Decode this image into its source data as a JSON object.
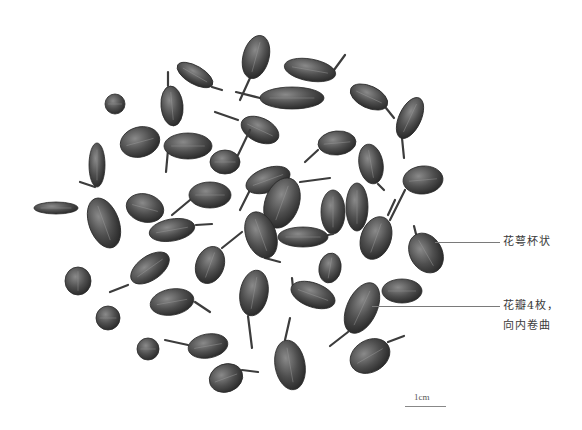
{
  "figure": {
    "background_color": "#ffffff",
    "specimen_color": "#4a4a4a"
  },
  "annotations": [
    {
      "id": "calyx",
      "text": "花萼杯状",
      "line_x1": 435,
      "line_x2": 500,
      "y": 242
    },
    {
      "id": "petals",
      "line1": "花瓣4枚，",
      "line2": "向内卷曲",
      "line_x1": 372,
      "line_x2": 500,
      "y": 306
    }
  ],
  "scale_bar": {
    "label": "1cm",
    "x1": 405,
    "x2": 446,
    "y": 406
  },
  "specimens": [
    {
      "cx": 256,
      "cy": 57,
      "rx": 13,
      "ry": 22,
      "rot": 15,
      "stem": [
        [
          250,
          78
        ],
        [
          240,
          100
        ]
      ]
    },
    {
      "cx": 310,
      "cy": 70,
      "rx": 26,
      "ry": 11,
      "rot": 10,
      "stem": [
        [
          334,
          70
        ],
        [
          345,
          55
        ]
      ]
    },
    {
      "cx": 195,
      "cy": 75,
      "rx": 20,
      "ry": 9,
      "rot": 30,
      "stem": [
        [
          212,
          87
        ],
        [
          222,
          90
        ]
      ]
    },
    {
      "cx": 115,
      "cy": 104,
      "rx": 10,
      "ry": 10,
      "rot": 0,
      "stem": null
    },
    {
      "cx": 172,
      "cy": 106,
      "rx": 11,
      "ry": 20,
      "rot": -5,
      "stem": [
        [
          168,
          86
        ],
        [
          168,
          72
        ]
      ]
    },
    {
      "cx": 292,
      "cy": 98,
      "rx": 32,
      "ry": 11,
      "rot": 0,
      "stem": [
        [
          260,
          98
        ],
        [
          236,
          92
        ]
      ]
    },
    {
      "cx": 369,
      "cy": 97,
      "rx": 20,
      "ry": 11,
      "rot": 25,
      "stem": [
        [
          386,
          108
        ],
        [
          394,
          118
        ]
      ]
    },
    {
      "cx": 410,
      "cy": 118,
      "rx": 11,
      "ry": 22,
      "rot": 25,
      "stem": [
        [
          402,
          138
        ],
        [
          404,
          158
        ]
      ]
    },
    {
      "cx": 140,
      "cy": 142,
      "rx": 20,
      "ry": 15,
      "rot": -15,
      "stem": null
    },
    {
      "cx": 188,
      "cy": 146,
      "rx": 24,
      "ry": 13,
      "rot": 0,
      "stem": [
        [
          168,
          150
        ],
        [
          166,
          172
        ]
      ]
    },
    {
      "cx": 260,
      "cy": 130,
      "rx": 20,
      "ry": 12,
      "rot": 25,
      "stem": [
        [
          238,
          120
        ],
        [
          215,
          112
        ]
      ]
    },
    {
      "cx": 225,
      "cy": 162,
      "rx": 15,
      "ry": 12,
      "rot": 0,
      "stem": [
        [
          238,
          155
        ],
        [
          250,
          130
        ]
      ]
    },
    {
      "cx": 337,
      "cy": 143,
      "rx": 19,
      "ry": 12,
      "rot": -5,
      "stem": [
        [
          318,
          150
        ],
        [
          305,
          162
        ]
      ]
    },
    {
      "cx": 371,
      "cy": 164,
      "rx": 12,
      "ry": 20,
      "rot": -10,
      "stem": [
        [
          378,
          184
        ],
        [
          384,
          190
        ]
      ]
    },
    {
      "cx": 97,
      "cy": 165,
      "rx": 8,
      "ry": 22,
      "rot": 0,
      "stem": [
        [
          95,
          187
        ],
        [
          80,
          182
        ]
      ]
    },
    {
      "cx": 56,
      "cy": 208,
      "rx": 22,
      "ry": 6,
      "rot": 0,
      "stem": null
    },
    {
      "cx": 104,
      "cy": 223,
      "rx": 15,
      "ry": 26,
      "rot": -20,
      "stem": null
    },
    {
      "cx": 145,
      "cy": 208,
      "rx": 19,
      "ry": 14,
      "rot": 15,
      "stem": null
    },
    {
      "cx": 210,
      "cy": 195,
      "rx": 21,
      "ry": 13,
      "rot": 0,
      "stem": [
        [
          190,
          200
        ],
        [
          172,
          215
        ]
      ]
    },
    {
      "cx": 268,
      "cy": 180,
      "rx": 23,
      "ry": 12,
      "rot": -20,
      "stem": [
        [
          250,
          190
        ],
        [
          240,
          210
        ]
      ]
    },
    {
      "cx": 282,
      "cy": 203,
      "rx": 17,
      "ry": 26,
      "rot": 20,
      "stem": [
        [
          300,
          182
        ],
        [
          330,
          178
        ]
      ]
    },
    {
      "cx": 333,
      "cy": 212,
      "rx": 12,
      "ry": 22,
      "rot": 0,
      "stem": null
    },
    {
      "cx": 357,
      "cy": 207,
      "rx": 11,
      "ry": 24,
      "rot": 0,
      "stem": null
    },
    {
      "cx": 423,
      "cy": 180,
      "rx": 20,
      "ry": 14,
      "rot": -5,
      "stem": [
        [
          405,
          190
        ],
        [
          390,
          220
        ]
      ]
    },
    {
      "cx": 172,
      "cy": 230,
      "rx": 23,
      "ry": 11,
      "rot": -10,
      "stem": [
        [
          196,
          225
        ],
        [
          212,
          224
        ]
      ]
    },
    {
      "cx": 261,
      "cy": 235,
      "rx": 15,
      "ry": 24,
      "rot": -20,
      "stem": [
        [
          265,
          258
        ],
        [
          280,
          262
        ]
      ]
    },
    {
      "cx": 303,
      "cy": 237,
      "rx": 25,
      "ry": 10,
      "rot": 0,
      "stem": [
        [
          328,
          235
        ],
        [
          333,
          234
        ]
      ]
    },
    {
      "cx": 376,
      "cy": 238,
      "rx": 15,
      "ry": 22,
      "rot": 20,
      "stem": [
        [
          388,
          215
        ],
        [
          395,
          200
        ]
      ]
    },
    {
      "cx": 426,
      "cy": 253,
      "rx": 16,
      "ry": 21,
      "rot": -30,
      "stem": [
        [
          416,
          234
        ],
        [
          414,
          226
        ]
      ]
    },
    {
      "cx": 210,
      "cy": 265,
      "rx": 14,
      "ry": 19,
      "rot": 20,
      "stem": [
        [
          222,
          248
        ],
        [
          242,
          232
        ]
      ]
    },
    {
      "cx": 150,
      "cy": 268,
      "rx": 22,
      "ry": 12,
      "rot": -35,
      "stem": [
        [
          128,
          285
        ],
        [
          110,
          292
        ]
      ]
    },
    {
      "cx": 78,
      "cy": 281,
      "rx": 13,
      "ry": 14,
      "rot": 0,
      "stem": null
    },
    {
      "cx": 330,
      "cy": 268,
      "rx": 11,
      "ry": 15,
      "rot": 10,
      "stem": null
    },
    {
      "cx": 254,
      "cy": 293,
      "rx": 14,
      "ry": 23,
      "rot": 10,
      "stem": [
        [
          248,
          316
        ],
        [
          252,
          348
        ]
      ]
    },
    {
      "cx": 313,
      "cy": 295,
      "rx": 23,
      "ry": 12,
      "rot": 20,
      "stem": [
        [
          293,
          288
        ],
        [
          292,
          278
        ]
      ]
    },
    {
      "cx": 362,
      "cy": 308,
      "rx": 15,
      "ry": 27,
      "rot": 25,
      "stem": [
        [
          348,
          332
        ],
        [
          330,
          346
        ]
      ]
    },
    {
      "cx": 402,
      "cy": 291,
      "rx": 20,
      "ry": 12,
      "rot": 0,
      "stem": null
    },
    {
      "cx": 172,
      "cy": 302,
      "rx": 22,
      "ry": 13,
      "rot": -10,
      "stem": [
        [
          195,
          302
        ],
        [
          210,
          312
        ]
      ]
    },
    {
      "cx": 108,
      "cy": 318,
      "rx": 12,
      "ry": 12,
      "rot": 0,
      "stem": null
    },
    {
      "cx": 148,
      "cy": 349,
      "rx": 11,
      "ry": 11,
      "rot": 0,
      "stem": null
    },
    {
      "cx": 208,
      "cy": 346,
      "rx": 20,
      "ry": 12,
      "rot": -10,
      "stem": [
        [
          188,
          345
        ],
        [
          165,
          340
        ]
      ]
    },
    {
      "cx": 290,
      "cy": 365,
      "rx": 15,
      "ry": 25,
      "rot": -10,
      "stem": [
        [
          285,
          340
        ],
        [
          290,
          318
        ]
      ]
    },
    {
      "cx": 370,
      "cy": 356,
      "rx": 21,
      "ry": 16,
      "rot": -30,
      "stem": [
        [
          388,
          342
        ],
        [
          404,
          336
        ]
      ]
    },
    {
      "cx": 226,
      "cy": 378,
      "rx": 17,
      "ry": 14,
      "rot": -20,
      "stem": [
        [
          242,
          370
        ],
        [
          258,
          372
        ]
      ]
    }
  ]
}
